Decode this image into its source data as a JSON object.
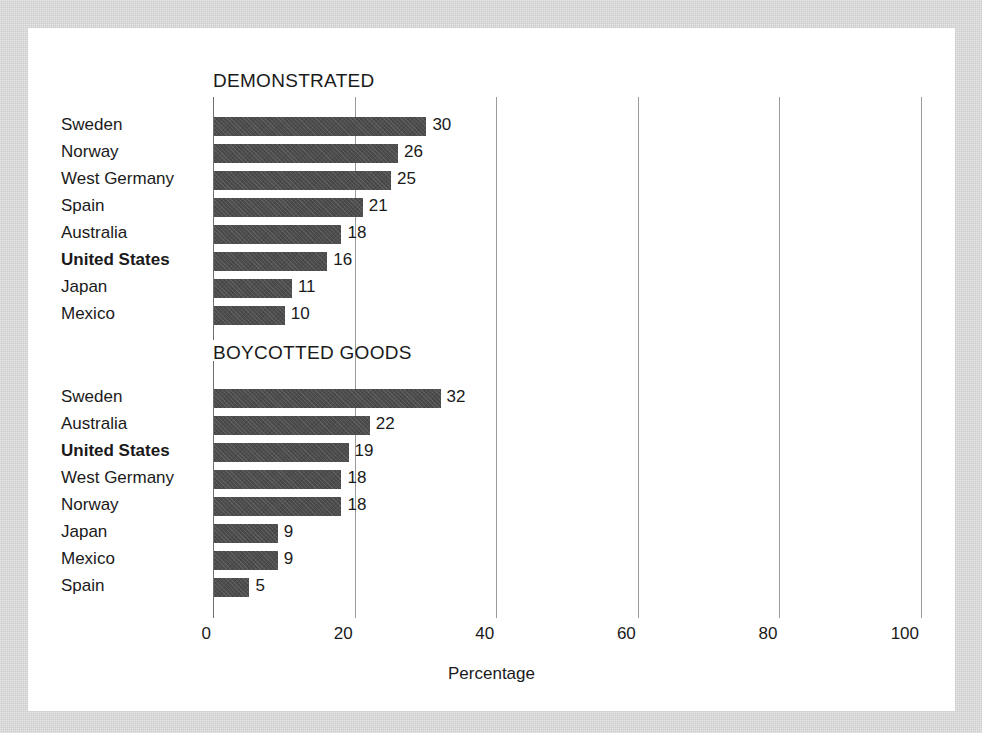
{
  "chart_data": {
    "type": "bar",
    "orientation": "horizontal",
    "title": "",
    "xlabel": "Percentage",
    "ylabel": "",
    "xlim": [
      0,
      100
    ],
    "xticks": [
      0,
      20,
      40,
      60,
      80,
      100
    ],
    "xtick_labels": [
      "0",
      "20",
      "40",
      "60",
      "80",
      "100"
    ],
    "grid": true,
    "legend": "none",
    "highlight_category": "United States",
    "bar_color": "#4d4d4d",
    "gridline_color": "#9a9a9a",
    "panels": [
      {
        "heading": "DEMONSTRATED",
        "categories": [
          "Sweden",
          "Norway",
          "West Germany",
          "Spain",
          "Australia",
          "United States",
          "Japan",
          "Mexico"
        ],
        "values": [
          30,
          26,
          25,
          21,
          18,
          16,
          11,
          10
        ],
        "value_labels": [
          "30",
          "26",
          "25",
          "21",
          "18",
          "16",
          "11",
          "10"
        ],
        "bold_categories": [
          "United States"
        ]
      },
      {
        "heading": "BOYCOTTED GOODS",
        "categories": [
          "Sweden",
          "Australia",
          "United States",
          "West Germany",
          "Norway",
          "Japan",
          "Mexico",
          "Spain"
        ],
        "values": [
          32,
          22,
          19,
          18,
          18,
          9,
          9,
          5
        ],
        "value_labels": [
          "32",
          "22",
          "19",
          "18",
          "18",
          "9",
          "9",
          "5"
        ],
        "bold_categories": [
          "United States"
        ]
      }
    ]
  }
}
